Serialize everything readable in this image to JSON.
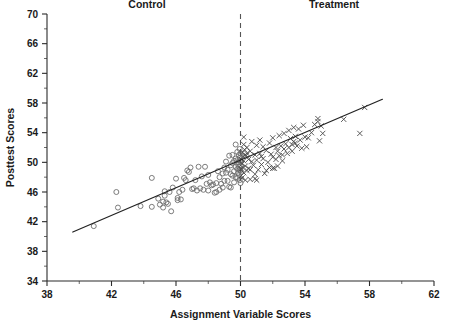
{
  "chart_data": {
    "type": "scatter",
    "title": "",
    "xlabel": "Assignment Variable Scores",
    "ylabel": "Posttest Scores",
    "xlim": [
      38,
      62
    ],
    "ylim": [
      34,
      70
    ],
    "xticks": [
      38,
      42,
      46,
      50,
      54,
      58,
      62
    ],
    "yticks": [
      34,
      38,
      42,
      46,
      50,
      54,
      58,
      62,
      66,
      70
    ],
    "xticks_minor": [
      40,
      44,
      48,
      52,
      56,
      60
    ],
    "yticks_minor": [
      36,
      40,
      44,
      48,
      52,
      56,
      60,
      64,
      68
    ],
    "grid": false,
    "legend": "none",
    "annotations": [
      {
        "text": "Control",
        "x": 44.2,
        "y": 70.8
      },
      {
        "text": "Treatment",
        "x": 55.8,
        "y": 70.8
      }
    ],
    "cutoff": {
      "x": 50,
      "style": "dashed",
      "label": ""
    },
    "fit_line": {
      "x": [
        39.6,
        58.8
      ],
      "y": [
        40.6,
        58.5
      ],
      "style": "solid"
    },
    "series": [
      {
        "name": "Control",
        "marker": "open-circle",
        "color": "#6e6e6e",
        "points": [
          [
            40.9,
            41.4
          ],
          [
            42.3,
            46.0
          ],
          [
            42.4,
            43.9
          ],
          [
            43.8,
            44.1
          ],
          [
            44.5,
            47.9
          ],
          [
            44.5,
            44.0
          ],
          [
            45.0,
            44.3
          ],
          [
            45.2,
            44.7
          ],
          [
            45.2,
            43.9
          ],
          [
            45.3,
            45.5
          ],
          [
            45.3,
            46.1
          ],
          [
            45.4,
            44.6
          ],
          [
            45.5,
            44.4
          ],
          [
            45.6,
            46.0
          ],
          [
            45.7,
            43.4
          ],
          [
            46.0,
            47.8
          ],
          [
            46.1,
            45.2
          ],
          [
            46.2,
            46.0
          ],
          [
            46.3,
            45.0
          ],
          [
            46.5,
            47.9
          ],
          [
            46.6,
            47.6
          ],
          [
            46.7,
            48.9
          ],
          [
            46.8,
            48.7
          ],
          [
            46.9,
            49.3
          ],
          [
            47.0,
            46.4
          ],
          [
            47.1,
            46.5
          ],
          [
            47.2,
            47.6
          ],
          [
            47.3,
            46.2
          ],
          [
            47.4,
            49.4
          ],
          [
            47.5,
            46.5
          ],
          [
            47.8,
            49.4
          ],
          [
            47.9,
            47.1
          ],
          [
            48.0,
            46.2
          ],
          [
            48.1,
            47.3
          ],
          [
            48.2,
            46.9
          ],
          [
            48.3,
            47.0
          ],
          [
            48.4,
            45.9
          ],
          [
            48.5,
            47.2
          ],
          [
            48.5,
            46.0
          ],
          [
            48.6,
            48.8
          ],
          [
            48.7,
            48.0
          ],
          [
            48.8,
            47.1
          ],
          [
            48.9,
            46.6
          ],
          [
            48.9,
            48.5
          ],
          [
            49.0,
            49.3
          ],
          [
            49.0,
            47.5
          ],
          [
            49.1,
            48.6
          ],
          [
            49.1,
            50.1
          ],
          [
            49.2,
            47.5
          ],
          [
            49.2,
            49.0
          ],
          [
            49.3,
            46.7
          ],
          [
            49.3,
            50.9
          ],
          [
            49.4,
            48.4
          ],
          [
            49.4,
            49.6
          ],
          [
            49.5,
            48.2
          ],
          [
            49.5,
            49.9
          ],
          [
            49.5,
            51.0
          ],
          [
            49.6,
            48.8
          ],
          [
            49.6,
            50.2
          ],
          [
            49.6,
            47.3
          ],
          [
            49.7,
            49.4
          ],
          [
            49.7,
            50.5
          ],
          [
            49.7,
            48.0
          ],
          [
            49.7,
            52.4
          ],
          [
            49.8,
            49.1
          ],
          [
            49.8,
            50.3
          ],
          [
            49.8,
            51.4
          ],
          [
            49.8,
            47.9
          ],
          [
            49.85,
            48.6
          ],
          [
            49.85,
            49.7
          ],
          [
            49.9,
            50.0
          ],
          [
            49.9,
            51.0
          ],
          [
            49.9,
            48.3
          ],
          [
            49.9,
            49.4
          ],
          [
            49.95,
            50.6
          ],
          [
            49.95,
            49.0
          ],
          [
            49.95,
            47.6
          ],
          [
            49.95,
            51.8
          ],
          [
            50.0,
            50.2
          ],
          [
            50.0,
            48.9
          ],
          [
            50.0,
            49.6
          ],
          [
            50.0,
            51.2
          ],
          [
            50.0,
            47.2
          ],
          [
            49.4,
            46.6
          ],
          [
            48.0,
            48.3
          ],
          [
            47.6,
            48.1
          ],
          [
            46.4,
            46.3
          ],
          [
            45.8,
            46.6
          ],
          [
            44.9,
            45.1
          ],
          [
            46.1,
            44.9
          ],
          [
            47.7,
            46.3
          ],
          [
            48.7,
            46.3
          ]
        ]
      },
      {
        "name": "Treatment",
        "marker": "cross",
        "color": "#4a4a4a",
        "points": [
          [
            50.05,
            50.4
          ],
          [
            50.05,
            49.1
          ],
          [
            50.05,
            48.2
          ],
          [
            50.1,
            51.3
          ],
          [
            50.1,
            49.8
          ],
          [
            50.1,
            47.9
          ],
          [
            50.15,
            50.8
          ],
          [
            50.15,
            49.3
          ],
          [
            50.2,
            53.4
          ],
          [
            50.2,
            50.2
          ],
          [
            50.2,
            48.6
          ],
          [
            50.25,
            51.7
          ],
          [
            50.3,
            49.5
          ],
          [
            50.3,
            47.6
          ],
          [
            50.35,
            50.9
          ],
          [
            50.4,
            52.0
          ],
          [
            50.4,
            48.9
          ],
          [
            50.5,
            50.4
          ],
          [
            50.5,
            49.2
          ],
          [
            50.6,
            51.5
          ],
          [
            50.6,
            47.7
          ],
          [
            50.7,
            50.1
          ],
          [
            50.7,
            52.8
          ],
          [
            50.8,
            49.6
          ],
          [
            50.9,
            51.0
          ],
          [
            50.9,
            48.4
          ],
          [
            51.0,
            52.3
          ],
          [
            51.0,
            50.3
          ],
          [
            51.1,
            49.0
          ],
          [
            51.2,
            53.0
          ],
          [
            51.2,
            51.2
          ],
          [
            51.3,
            49.7
          ],
          [
            51.4,
            52.1
          ],
          [
            51.4,
            50.5
          ],
          [
            51.5,
            48.5
          ],
          [
            51.6,
            51.6
          ],
          [
            51.7,
            50.0
          ],
          [
            51.8,
            52.6
          ],
          [
            51.8,
            49.3
          ],
          [
            51.9,
            51.1
          ],
          [
            52.0,
            53.3
          ],
          [
            52.0,
            50.7
          ],
          [
            52.1,
            49.2
          ],
          [
            52.2,
            52.0
          ],
          [
            52.2,
            50.4
          ],
          [
            52.3,
            51.5
          ],
          [
            52.4,
            53.6
          ],
          [
            52.4,
            50.9
          ],
          [
            52.5,
            52.2
          ],
          [
            52.6,
            51.0
          ],
          [
            52.7,
            53.9
          ],
          [
            52.7,
            51.8
          ],
          [
            52.8,
            52.5
          ],
          [
            52.9,
            51.2
          ],
          [
            53.0,
            54.3
          ],
          [
            53.0,
            52.0
          ],
          [
            53.1,
            53.2
          ],
          [
            53.2,
            51.5
          ],
          [
            53.3,
            54.7
          ],
          [
            53.3,
            52.8
          ],
          [
            53.4,
            53.5
          ],
          [
            53.5,
            52.2
          ],
          [
            53.6,
            54.5
          ],
          [
            53.7,
            53.0
          ],
          [
            53.8,
            51.9
          ],
          [
            53.9,
            55.0
          ],
          [
            54.0,
            53.4
          ],
          [
            54.1,
            52.1
          ],
          [
            54.2,
            53.3
          ],
          [
            54.4,
            54.0
          ],
          [
            54.6,
            55.1
          ],
          [
            54.8,
            55.5
          ],
          [
            54.8,
            55.9
          ],
          [
            54.9,
            52.9
          ],
          [
            55.0,
            54.9
          ],
          [
            55.1,
            53.9
          ],
          [
            56.4,
            55.8
          ],
          [
            57.4,
            53.9
          ],
          [
            57.7,
            57.4
          ],
          [
            51.0,
            47.6
          ],
          [
            50.9,
            47.8
          ],
          [
            52.0,
            49.2
          ],
          [
            52.3,
            49.5
          ],
          [
            53.2,
            52.4
          ],
          [
            53.4,
            52.6
          ],
          [
            50.4,
            51.2
          ],
          [
            50.6,
            49.0
          ],
          [
            51.6,
            48.9
          ],
          [
            51.3,
            50.8
          ],
          [
            52.6,
            50.2
          ],
          [
            50.2,
            52.4
          ],
          [
            50.3,
            51.0
          ]
        ]
      }
    ]
  }
}
